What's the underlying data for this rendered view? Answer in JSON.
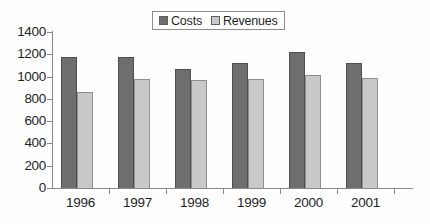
{
  "chart_data": {
    "type": "bar",
    "title": "",
    "subtitle": "",
    "xlabel": "",
    "ylabel": "",
    "categories": [
      "1996",
      "1997",
      "1998",
      "1999",
      "2000",
      "2001"
    ],
    "series": [
      {
        "name": "Costs",
        "color": "#6e6e6e",
        "values": [
          1180,
          1180,
          1070,
          1125,
          1220,
          1120
        ]
      },
      {
        "name": "Revenues",
        "color": "#c9c9c9",
        "values": [
          860,
          980,
          970,
          980,
          1015,
          990
        ]
      }
    ],
    "ylim": [
      0,
      1400
    ],
    "ytick_labels": [
      "1400",
      "1200",
      "1000",
      "800",
      "600",
      "400",
      "200",
      "0"
    ],
    "ytick_values": [
      1400,
      1200,
      1000,
      800,
      600,
      400,
      200,
      0
    ],
    "grid": false,
    "legend_position": "top-center",
    "legend_entries": [
      "Costs",
      "Revenues"
    ],
    "axis_color": "#8a8a8a",
    "background": "#ffffff"
  },
  "legend": {
    "items": [
      {
        "label": "Costs",
        "swatch": "legend-swatch-costs"
      },
      {
        "label": "Revenues",
        "swatch": "legend-swatch-revenues"
      }
    ]
  }
}
